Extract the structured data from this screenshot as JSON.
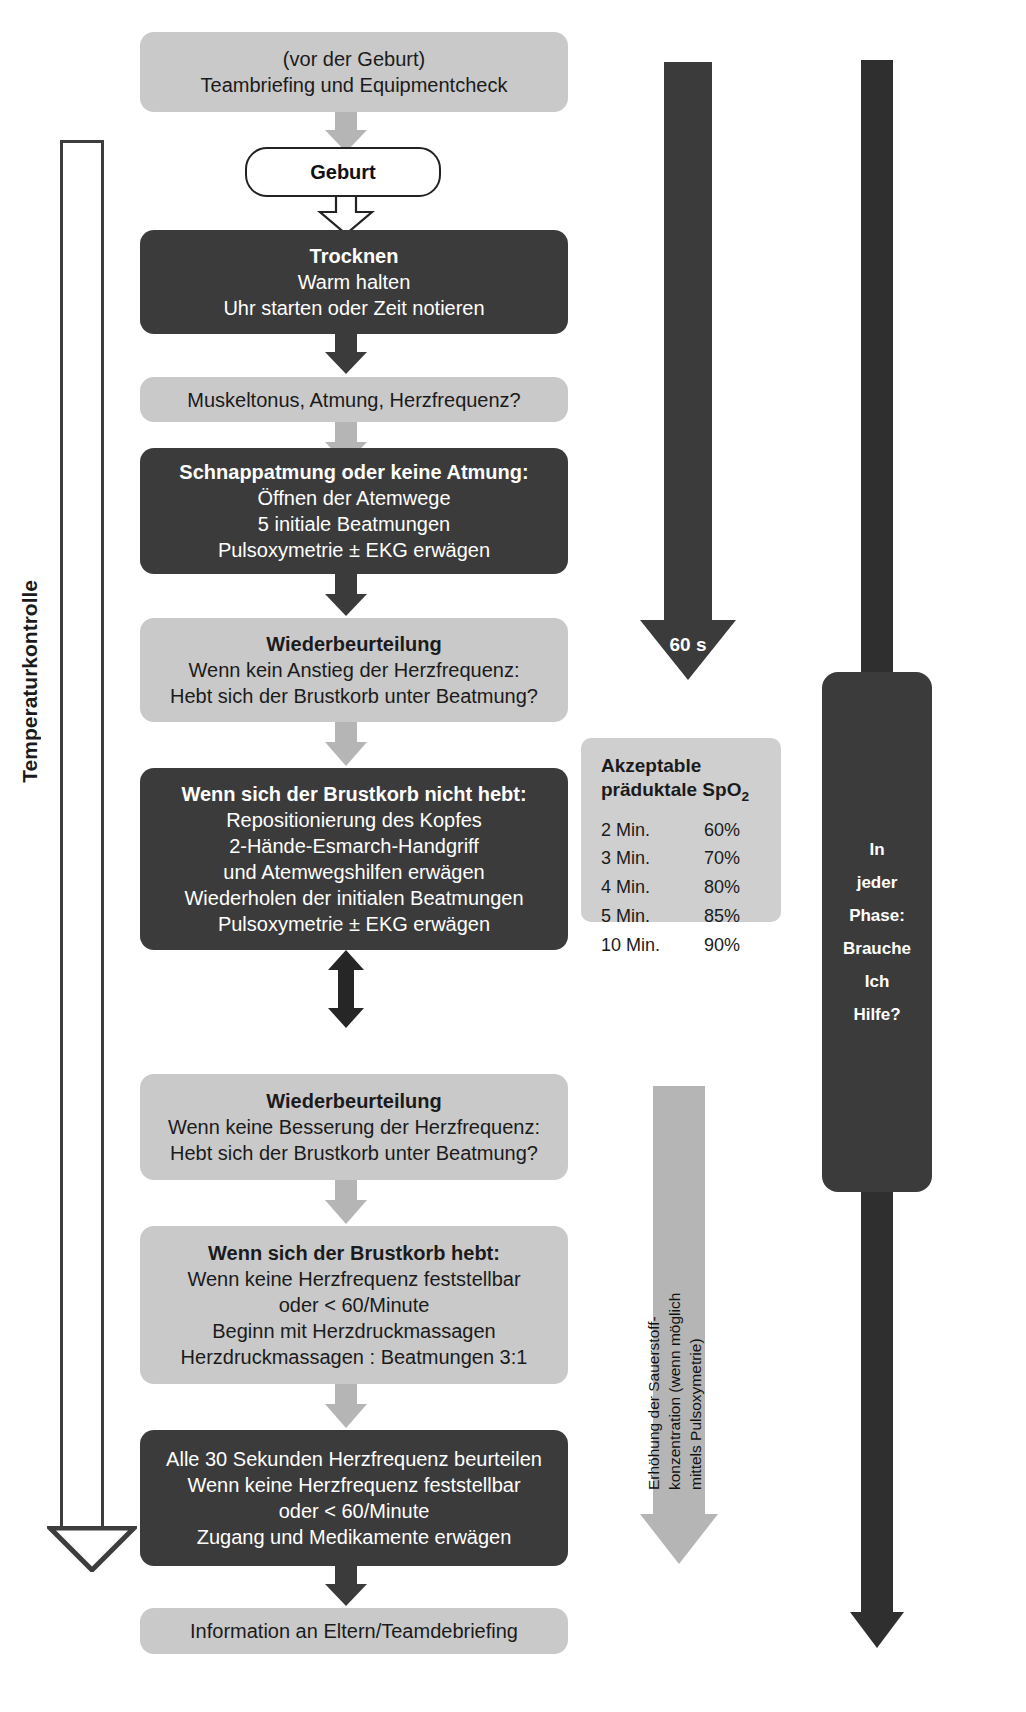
{
  "diagram": {
    "colors": {
      "dark_box": "#3b3b3b",
      "light_box": "#c9c9c9",
      "light_box_alt": "#cfcfcf",
      "arrow_grey": "#b5b5b5",
      "arrow_dark": "#3b3b3b",
      "text_light": "#ffffff",
      "text_dark": "#1b1b1b"
    }
  },
  "nodes": {
    "prebirth": {
      "style": "light",
      "lines": [
        "(vor der Geburt)",
        "Teambriefing und Equipmentcheck"
      ]
    },
    "birth": {
      "style": "white",
      "lines": [
        "Geburt"
      ]
    },
    "dry": {
      "style": "dark",
      "lines": [
        "Trocknen",
        "Warm halten",
        "Uhr starten oder Zeit notieren"
      ]
    },
    "assess1": {
      "style": "light",
      "lines": [
        "Muskeltonus, Atmung, Herzfrequenz?"
      ]
    },
    "gasping": {
      "style": "dark",
      "lines": [
        "Schnappatmung oder keine Atmung:",
        "Öffnen der Atemwege",
        "5 initiale Beatmungen",
        "Pulsoxymetrie ± EKG erwägen"
      ]
    },
    "reassess1": {
      "style": "light",
      "lines": [
        "Wiederbeurteilung",
        "Wenn kein Anstieg der Herzfrequenz:",
        "Hebt sich der Brustkorb unter Beatmung?"
      ]
    },
    "chest_not_rising": {
      "style": "dark",
      "lines": [
        "Wenn sich der Brustkorb nicht hebt:",
        "Repositionierung des Kopfes",
        "2-Hände-Esmarch-Handgriff",
        "und Atemwegshilfen erwägen",
        "Wiederholen der initialen Beatmungen",
        "Pulsoxymetrie ± EKG erwägen"
      ]
    },
    "reassess2": {
      "style": "light",
      "lines": [
        "Wiederbeurteilung",
        "Wenn keine Besserung der Herzfrequenz:",
        "Hebt sich der Brustkorb unter Beatmung?"
      ]
    },
    "chest_rising": {
      "style": "light",
      "lines": [
        "Wenn sich der Brustkorb hebt:",
        "Wenn keine Herzfrequenz feststellbar",
        "oder  < 60/Minute",
        "Beginn mit Herzdruckmassagen",
        "Herzdruckmassagen : Beatmungen 3:1"
      ]
    },
    "every30s": {
      "style": "dark",
      "lines": [
        "Alle 30 Sekunden Herzfrequenz beurteilen",
        "Wenn keine Herzfrequenz  feststellbar",
        "oder < 60/Minute",
        "Zugang und Medikamente erwägen"
      ]
    },
    "debriefing": {
      "style": "light",
      "lines": [
        "Information an Eltern/Teamdebriefing"
      ]
    }
  },
  "side": {
    "temperature_label": "Temperaturkontrolle",
    "sixty_seconds_label": "60 s",
    "oxygen_lines": [
      "Erhöhung der Sauerstoff-",
      "konzentration (wenn möglich",
      "mittels Pulsoxymetrie)"
    ],
    "help_lines": [
      "In",
      "jeder",
      "Phase:",
      "Brauche",
      "Ich",
      "Hilfe?"
    ]
  },
  "spo2": {
    "title_line1": "Akzeptable",
    "title_line2_pre": "präduktale SpO",
    "title_line2_sub": "2",
    "rows": [
      {
        "time": "2 Min.",
        "value": "60%"
      },
      {
        "time": "3 Min.",
        "value": "70%"
      },
      {
        "time": "4 Min.",
        "value": "80%"
      },
      {
        "time": "5 Min.",
        "value": "85%"
      },
      {
        "time": "10 Min.",
        "value": "90%"
      }
    ]
  }
}
